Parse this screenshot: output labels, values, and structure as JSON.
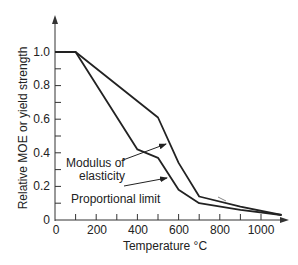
{
  "chart_data": {
    "type": "line",
    "title": "",
    "xlabel": "Temperature °C",
    "ylabel": "Relative MOE or yield strength",
    "xlim": [
      0,
      1100
    ],
    "ylim": [
      0,
      1.0
    ],
    "x_ticks": [
      0,
      200,
      400,
      600,
      800,
      1000
    ],
    "x_minor_ticks": [
      100,
      300,
      500,
      700,
      900
    ],
    "y_ticks": [
      "0",
      "0.2",
      "0.4",
      "0.6",
      "0.8",
      "1.0"
    ],
    "y_minor_ticks": [
      0.1,
      0.3,
      0.5,
      0.7,
      0.9
    ],
    "grid": false,
    "legend": "none (direct annotations with arrows)",
    "series": [
      {
        "name": "Modulus of elasticity",
        "x": [
          0,
          100,
          500,
          600,
          700,
          900,
          1100
        ],
        "values": [
          1.0,
          1.0,
          0.61,
          0.34,
          0.14,
          0.08,
          0.03
        ]
      },
      {
        "name": "Proportional limit",
        "x": [
          0,
          100,
          400,
          500,
          600,
          700,
          900,
          1100
        ],
        "values": [
          1.0,
          1.0,
          0.42,
          0.37,
          0.18,
          0.1,
          0.06,
          0.03
        ]
      }
    ],
    "annotations": [
      {
        "text_line1": "Modulus of",
        "text_line2": "elasticity",
        "points_to": "Modulus of elasticity"
      },
      {
        "text_line1": "Proportional limit",
        "points_to": "Proportional limit"
      }
    ]
  },
  "labels": {
    "xlabel": "Temperature °C",
    "ylabel": "Relative MOE or yield strength",
    "x_tick_labels": [
      "0",
      "200",
      "400",
      "600",
      "800",
      "1000"
    ],
    "y_tick_labels": [
      "0",
      "0.2",
      "0.4",
      "0.6",
      "0.8",
      "1.0"
    ],
    "moe_line1": "Modulus of",
    "moe_line2": "elasticity",
    "pl_label": "Proportional limit"
  },
  "colors": {
    "line": "#222222",
    "axis": "#333333",
    "background": "#ffffff"
  }
}
